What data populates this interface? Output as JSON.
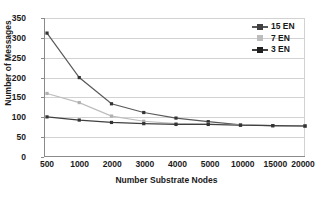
{
  "chart_data": {
    "type": "line",
    "title": "",
    "xlabel": "Number Substrate Nodes",
    "ylabel": "Number of Messages",
    "categories": [
      "500",
      "1000",
      "2000",
      "3000",
      "4000",
      "5000",
      "10000",
      "15000",
      "20000"
    ],
    "yticks": [
      "0",
      "50",
      "100",
      "150",
      "200",
      "250",
      "300",
      "350"
    ],
    "ylim": [
      0,
      350
    ],
    "grid": true,
    "legend_position": "top-right",
    "series": [
      {
        "name": "15 EN",
        "color": "#595959",
        "marker": "square",
        "values": [
          312,
          200,
          134,
          112,
          98,
          89,
          81,
          79,
          78
        ]
      },
      {
        "name": "7 EN",
        "color": "#bdbdbd",
        "marker": "square",
        "values": [
          160,
          137,
          103,
          90,
          84,
          83,
          81,
          79,
          78
        ]
      },
      {
        "name": "3 EN",
        "color": "#404040",
        "marker": "square",
        "values": [
          101,
          93,
          87,
          84,
          82,
          82,
          80,
          79,
          78
        ]
      }
    ]
  },
  "legend": {
    "items": [
      {
        "label": "15 EN"
      },
      {
        "label": "7 EN"
      },
      {
        "label": "3 EN"
      }
    ]
  },
  "colors": {
    "background": "#ffffff",
    "axis": "#8a8a8a",
    "grid": "#d2d2d2",
    "text": "#1a1a1a"
  }
}
